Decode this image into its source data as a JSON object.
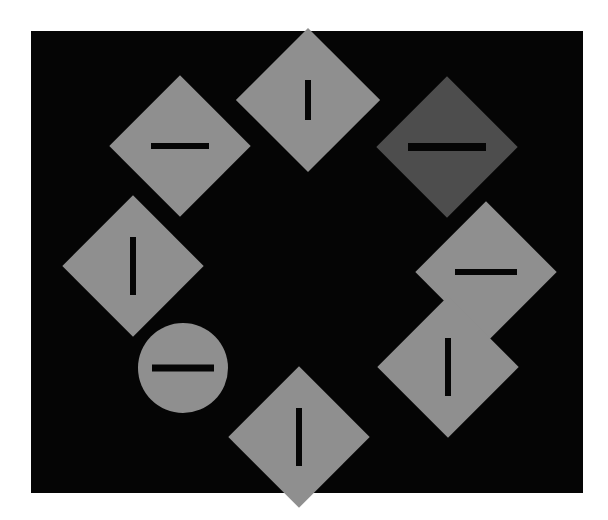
{
  "canvas": {
    "width": 608,
    "height": 520,
    "background_color": "#ffffff"
  },
  "display_panel": {
    "label": "stimulus-display",
    "x": 31,
    "y": 31,
    "width": 552,
    "height": 462,
    "background_color": "#050505"
  },
  "palette": {
    "background": "#050505",
    "page": "#ffffff",
    "shape_light_gray": "#8f8f8f",
    "shape_dark_gray": "#4d4d4d",
    "bar_black": "#050505"
  },
  "stimuli": {
    "count": 8,
    "arrangement": "ring",
    "ring_center_x": 307,
    "ring_center_y": 266,
    "items": [
      {
        "id": "item-top-center",
        "position_label": "top-center",
        "shape": "diamond",
        "fill_color": "#8f8f8f",
        "bar_orientation": "vertical",
        "center_x": 308,
        "center_y": 100,
        "size": 102,
        "bar_length": 40,
        "bar_thickness": 6,
        "is_target": false
      },
      {
        "id": "item-top-left",
        "position_label": "top-left",
        "shape": "diamond",
        "fill_color": "#8f8f8f",
        "bar_orientation": "horizontal",
        "center_x": 180,
        "center_y": 146,
        "size": 100,
        "bar_length": 58,
        "bar_thickness": 6,
        "is_target": false
      },
      {
        "id": "item-top-right",
        "position_label": "top-right",
        "shape": "diamond",
        "fill_color": "#4d4d4d",
        "bar_orientation": "horizontal",
        "center_x": 447,
        "center_y": 147,
        "size": 100,
        "bar_length": 78,
        "bar_thickness": 8,
        "is_target": true,
        "target_type": "color-singleton"
      },
      {
        "id": "item-left-upper",
        "position_label": "left-upper",
        "shape": "diamond",
        "fill_color": "#8f8f8f",
        "bar_orientation": "vertical",
        "center_x": 133,
        "center_y": 266,
        "size": 100,
        "bar_length": 58,
        "bar_thickness": 6,
        "is_target": false
      },
      {
        "id": "item-right-upper",
        "position_label": "right-upper",
        "shape": "diamond",
        "fill_color": "#8f8f8f",
        "bar_orientation": "horizontal",
        "center_x": 486,
        "center_y": 272,
        "size": 100,
        "bar_length": 62,
        "bar_thickness": 6,
        "is_target": false
      },
      {
        "id": "item-left-lower",
        "position_label": "left-lower",
        "shape": "circle",
        "fill_color": "#8f8f8f",
        "bar_orientation": "horizontal",
        "center_x": 183,
        "center_y": 368,
        "size": 90,
        "bar_length": 62,
        "bar_thickness": 7,
        "is_target": true,
        "target_type": "shape-singleton"
      },
      {
        "id": "item-right-lower",
        "position_label": "right-lower",
        "shape": "diamond",
        "fill_color": "#8f8f8f",
        "bar_orientation": "vertical",
        "center_x": 448,
        "center_y": 367,
        "size": 100,
        "bar_length": 58,
        "bar_thickness": 6,
        "is_target": false
      },
      {
        "id": "item-bottom-center",
        "position_label": "bottom-center",
        "shape": "diamond",
        "fill_color": "#8f8f8f",
        "bar_orientation": "vertical",
        "center_x": 299,
        "center_y": 437,
        "size": 100,
        "bar_length": 58,
        "bar_thickness": 6,
        "is_target": false
      }
    ]
  }
}
